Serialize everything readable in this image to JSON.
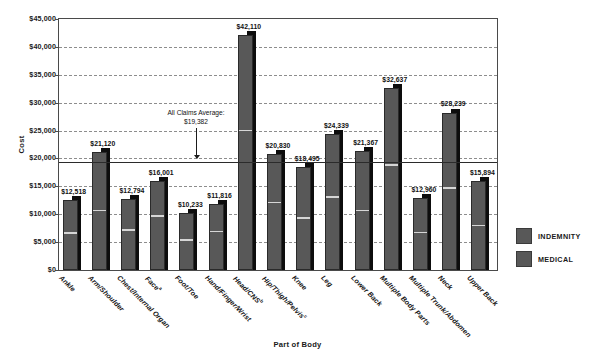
{
  "chart_data": {
    "type": "bar",
    "title": "",
    "xlabel": "Part of Body",
    "ylabel": "Cost",
    "ylim": [
      0,
      45000
    ],
    "ytick_values": [
      0,
      5000,
      10000,
      15000,
      20000,
      25000,
      30000,
      35000,
      40000,
      45000
    ],
    "ytick_labels": [
      "$0",
      "$5,000",
      "$10,000",
      "$15,000",
      "$20,000",
      "$25,000",
      "$30,000",
      "$35,000",
      "$40,000",
      "$45,000"
    ],
    "grid": true,
    "legend_position": "right",
    "stacked": true,
    "categories": [
      "Ankle",
      "Arm/Shoulder",
      "Chest/Internal Organ",
      "Face",
      "Foot/Toe",
      "Hand/Finger/Wrist",
      "Head/CNS",
      "Hip/Thigh/Pelvis",
      "Knee",
      "Leg",
      "Lower Back",
      "Multiple Body Parts",
      "Multiple Trunk/Abdomen",
      "Neck",
      "Upper Back"
    ],
    "category_footnotes": [
      "",
      "",
      "",
      "a",
      "",
      "",
      "b",
      "c",
      "",
      "",
      "",
      "",
      "",
      "",
      ""
    ],
    "series": [
      {
        "name": "INDEMNITY",
        "color": "#585858",
        "values": [
          6300,
          10400,
          6900,
          9400,
          5050,
          6650,
          24700,
          11800,
          9000,
          12800,
          10400,
          18500,
          6400,
          14400,
          7700
        ]
      },
      {
        "name": "MEDICAL",
        "color": "#585858",
        "values": [
          6218,
          10720,
          5894,
          6601,
          5183,
          5166,
          17410,
          9030,
          9495,
          11539,
          10967,
          14137,
          6560,
          13839,
          8194
        ]
      }
    ],
    "totals": [
      12518,
      21120,
      12794,
      16001,
      10233,
      11816,
      42110,
      20830,
      18495,
      24339,
      21367,
      32637,
      12960,
      28239,
      15894
    ],
    "total_labels": [
      "$12,518",
      "$21,120",
      "$12,794",
      "$16,001",
      "$10,233",
      "$11,816",
      "$42,110",
      "$20,830",
      "$18,495",
      "$24,339",
      "$21,367",
      "$32,637",
      "$12,960",
      "$28,239",
      "$15,894"
    ],
    "annotations": [
      {
        "name": "all-claims-average",
        "line1": "All Claims Average:",
        "line2": "$19,382",
        "value": 19382,
        "style": "reference-line-with-arrow"
      }
    ]
  },
  "legend": {
    "items": [
      {
        "label": "INDEMNITY",
        "color": "#585858"
      },
      {
        "label": "MEDICAL",
        "color": "#585858"
      }
    ]
  }
}
